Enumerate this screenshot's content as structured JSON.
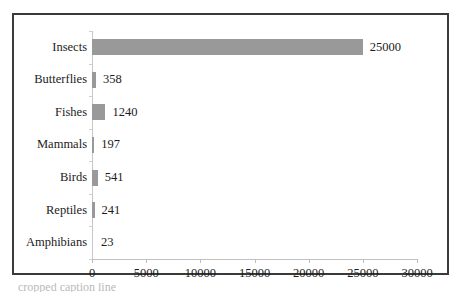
{
  "chart_data": {
    "type": "bar",
    "orientation": "horizontal",
    "title": "",
    "xlabel": "",
    "ylabel": "",
    "categories": [
      "Insects",
      "Butterflies",
      "Fishes",
      "Mammals",
      "Birds",
      "Reptiles",
      "Amphibians"
    ],
    "values": [
      25000,
      358,
      1240,
      197,
      541,
      241,
      23
    ],
    "value_labels": [
      "25000",
      "358",
      "1240",
      "197",
      "541",
      "241",
      "23"
    ],
    "xlim": [
      0,
      30000
    ],
    "xticks": [
      0,
      5000,
      10000,
      15000,
      20000,
      25000,
      30000
    ],
    "xtick_labels": [
      "0",
      "5000",
      "10000",
      "15000",
      "20000",
      "25000",
      "30000"
    ],
    "grid": false,
    "legend": false,
    "bar_color": "#999999",
    "frame_color": "#3a3a3a",
    "axis_color": "#c0c0c0",
    "text_color": "#1c1c1c"
  },
  "caption": {
    "text": "cropped caption line"
  }
}
